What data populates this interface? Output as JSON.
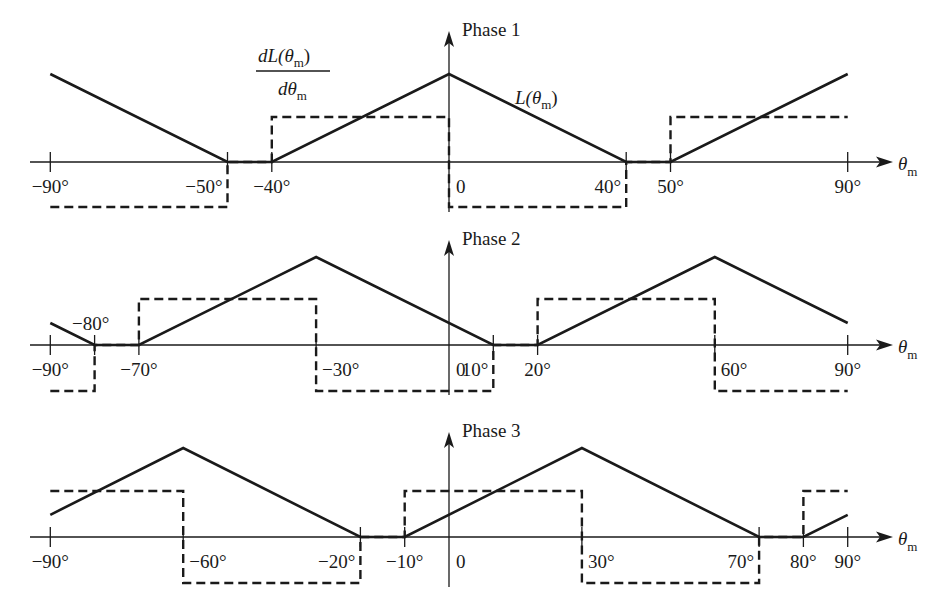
{
  "figure": {
    "x_axis_label": "θ",
    "x_axis_label_sub": "m",
    "derivative_label_num": "dL(θ",
    "derivative_label_num_sub": "m",
    "derivative_label_num_close": ")",
    "derivative_label_den": "dθ",
    "derivative_label_den_sub": "m",
    "inductance_label": "L(θ",
    "inductance_label_sub": "m",
    "inductance_label_close": ")",
    "colors": {
      "line": "#1a1a1a",
      "background": "#ffffff"
    }
  },
  "chart_data": [
    {
      "type": "line",
      "title": "Phase 1",
      "xlabel": "θm",
      "ylabel": "",
      "xlim": [
        -90,
        90
      ],
      "tick_labels": [
        "−90°",
        "−50°",
        "−40°",
        "0",
        "40°",
        "50°",
        "90°"
      ],
      "tick_positions": [
        -90,
        -50,
        -40,
        0,
        40,
        50,
        90
      ],
      "series": [
        {
          "name": "L(θm)",
          "style": "solid",
          "x": [
            -90,
            -50,
            -40,
            0,
            40,
            50,
            90
          ],
          "y": [
            1,
            0,
            0,
            1,
            0,
            0,
            1
          ]
        },
        {
          "name": "dL(θm)/dθm",
          "style": "dashed",
          "x": [
            -90,
            -50,
            -50,
            -40,
            -40,
            0,
            0,
            40,
            40,
            50,
            50,
            90
          ],
          "y": [
            -1,
            -1,
            0,
            0,
            1,
            1,
            -1,
            -1,
            0,
            0,
            1,
            1
          ]
        }
      ]
    },
    {
      "type": "line",
      "title": "Phase 2",
      "xlabel": "θm",
      "ylabel": "",
      "xlim": [
        -90,
        90
      ],
      "tick_labels": [
        "−90°",
        "−80°",
        "−70°",
        "−30°",
        "0",
        "10°",
        "20°",
        "60°",
        "90°"
      ],
      "tick_positions": [
        -90,
        -80,
        -70,
        -30,
        0,
        10,
        20,
        60,
        90
      ],
      "series": [
        {
          "name": "L(θm)",
          "style": "solid",
          "x": [
            -90,
            -80,
            -70,
            -30,
            10,
            20,
            60,
            90
          ],
          "y": [
            0.25,
            0,
            0,
            1,
            0,
            0,
            1,
            0.25
          ]
        },
        {
          "name": "dL(θm)/dθm",
          "style": "dashed",
          "x": [
            -90,
            -80,
            -80,
            -70,
            -70,
            -30,
            -30,
            10,
            10,
            20,
            20,
            60,
            60,
            90
          ],
          "y": [
            -1,
            -1,
            0,
            0,
            1,
            1,
            -1,
            -1,
            0,
            0,
            1,
            1,
            -1,
            -1
          ]
        }
      ]
    },
    {
      "type": "line",
      "title": "Phase 3",
      "xlabel": "θm",
      "ylabel": "",
      "xlim": [
        -90,
        90
      ],
      "tick_labels": [
        "−90°",
        "−60°",
        "−20°",
        "−10°",
        "0",
        "30°",
        "70°",
        "80°",
        "90°"
      ],
      "tick_positions": [
        -90,
        -60,
        -20,
        -10,
        0,
        30,
        70,
        80,
        90
      ],
      "series": [
        {
          "name": "L(θm)",
          "style": "solid",
          "x": [
            -90,
            -60,
            -20,
            -10,
            30,
            70,
            80,
            90
          ],
          "y": [
            0.25,
            1,
            0,
            0,
            1,
            0,
            0,
            0.25
          ]
        },
        {
          "name": "dL(θm)/dθm",
          "style": "dashed",
          "x": [
            -90,
            -60,
            -60,
            -20,
            -20,
            -10,
            -10,
            30,
            30,
            70,
            70,
            80,
            80,
            90
          ],
          "y": [
            1,
            1,
            -1,
            -1,
            0,
            0,
            1,
            1,
            -1,
            -1,
            0,
            0,
            1,
            1
          ]
        }
      ]
    }
  ]
}
